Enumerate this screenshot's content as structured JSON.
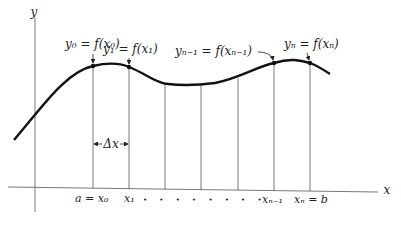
{
  "diagram": {
    "axes": {
      "x_label": "x",
      "y_label": "y"
    },
    "point_labels": {
      "y0": "y₀ = f(x₀)",
      "y1": "y₁ = f(x₁)",
      "yn1": "yₙ₋₁ = f(xₙ₋₁)",
      "yn": "yₙ = f(xₙ)"
    },
    "delta_label": "Δx",
    "tick_labels": {
      "a": "a = x₀",
      "x1": "x₁",
      "dots": "• • • • • • • •",
      "xn1": "xₙ₋₁",
      "b": "xₙ = b"
    }
  }
}
